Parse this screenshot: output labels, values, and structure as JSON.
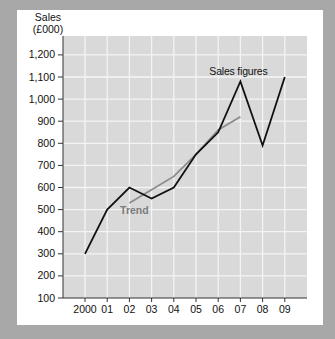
{
  "colors": {
    "background": "#a8a8a8",
    "panel": "#ffffff",
    "plot_fill": "#d9d9d9",
    "grid": "#f4f4f4",
    "sales_line": "#111111",
    "trend_line": "#8c8c8c",
    "trend_label": "#7a7a7a"
  },
  "chart_data": {
    "type": "line",
    "title": "",
    "ylabel": "Sales (£000)",
    "ylabel_lines": [
      "Sales",
      "(£000)"
    ],
    "xlabel": "",
    "ylim": [
      100,
      1200
    ],
    "y_ticks": [
      100,
      200,
      300,
      400,
      500,
      600,
      700,
      800,
      900,
      1000,
      1100,
      1200
    ],
    "y_tick_labels": [
      "100",
      "200",
      "300",
      "400",
      "500",
      "600",
      "700",
      "800",
      "900",
      "1,000",
      "1,100",
      "1,200"
    ],
    "categories": [
      "2000",
      "01",
      "02",
      "03",
      "04",
      "05",
      "06",
      "07",
      "08",
      "09"
    ],
    "grid": true,
    "series": [
      {
        "name": "Sales figures",
        "values": [
          300,
          500,
          600,
          550,
          600,
          750,
          850,
          1080,
          790,
          1100
        ]
      },
      {
        "name": "Trend",
        "x_range": [
          "02",
          "07"
        ],
        "values": [
          null,
          null,
          530,
          590,
          650,
          750,
          860,
          920,
          null,
          null
        ]
      }
    ],
    "annotations": [
      {
        "text": "Sales figures",
        "near": "07"
      },
      {
        "text": "Trend",
        "near": "02"
      }
    ]
  }
}
